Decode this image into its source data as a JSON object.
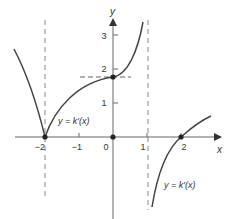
{
  "figure": {
    "axes": {
      "x_label": "x",
      "y_label": "y",
      "x_ticks": [
        {
          "value": -2,
          "label": "−2"
        },
        {
          "value": -1,
          "label": "−1"
        },
        {
          "value": 0,
          "label": "0"
        },
        {
          "value": 1,
          "label": "1"
        },
        {
          "value": 2,
          "label": "2"
        }
      ],
      "y_ticks": [
        {
          "value": 1,
          "label": "1"
        },
        {
          "value": 2,
          "label": "2"
        },
        {
          "value": 3,
          "label": "3"
        }
      ]
    },
    "curve_labels": {
      "upper": "y = k′(x)",
      "lower": "y = k′(x)"
    },
    "asymptotes": [
      {
        "x": -2,
        "style": "dashed"
      },
      {
        "x": 1.03,
        "style": "dashed"
      }
    ],
    "marked_points": [
      {
        "x": -2,
        "y": 0
      },
      {
        "x": 0,
        "y": 0
      },
      {
        "x": 0,
        "y": 1.75
      },
      {
        "x": 2,
        "y": 0
      }
    ],
    "horizontal_guide": {
      "y": 1.75,
      "style": "dashed"
    },
    "colors": {
      "curve": "#444444",
      "axis": "#555555",
      "dash": "#777777",
      "point": "#222222"
    }
  }
}
